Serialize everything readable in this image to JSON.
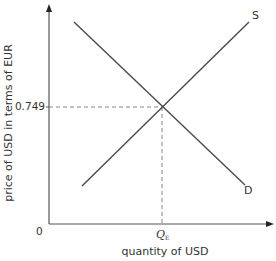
{
  "diagram": {
    "type": "supply-demand",
    "y_axis_label": "price of USD in terms of EUR",
    "x_axis_label": "quantity of USD",
    "origin_label": "0",
    "equilibrium_price_label": "0.749",
    "equilibrium_quantity_label": "Q",
    "equilibrium_quantity_subscript": "E",
    "curves": [
      {
        "name": "supply",
        "label": "S",
        "direction": "upward-sloping"
      },
      {
        "name": "demand",
        "label": "D",
        "direction": "downward-sloping"
      }
    ],
    "colors": {
      "line": "#4a4a4a",
      "axis": "#555555",
      "dashed": "#777777",
      "text": "#333333"
    }
  }
}
